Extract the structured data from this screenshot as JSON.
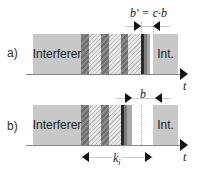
{
  "panels": [
    {
      "label": "a)",
      "interferer_label": "Interferer",
      "int_label": "Int.",
      "axis_label": "t",
      "dimension_label": "b' = c·b"
    },
    {
      "label": "b)",
      "interferer_label": "Interferer",
      "int_label": "Int.",
      "axis_label": "t",
      "gap_label": "b",
      "span_label": "k",
      "span_subscript": "i"
    }
  ],
  "colors": {
    "block": "#c8c8c8",
    "dark_bar": "#2a2a2a",
    "axis": "#888888"
  }
}
